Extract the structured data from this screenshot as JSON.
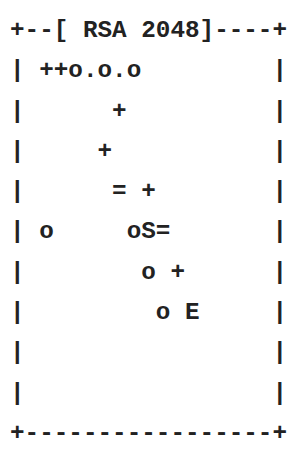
{
  "randomart": {
    "key_type": "RSA",
    "key_bits": "2048",
    "header": "+--[ RSA 2048]----+",
    "rows": [
      "| ++o.o.o         |",
      "|      +          |",
      "|     +           |",
      "|      = +        |",
      "| o     oS=       |",
      "|        o +      |",
      "|         o E     |",
      "|                 |",
      "|                 |"
    ],
    "footer": "+-----------------+"
  }
}
